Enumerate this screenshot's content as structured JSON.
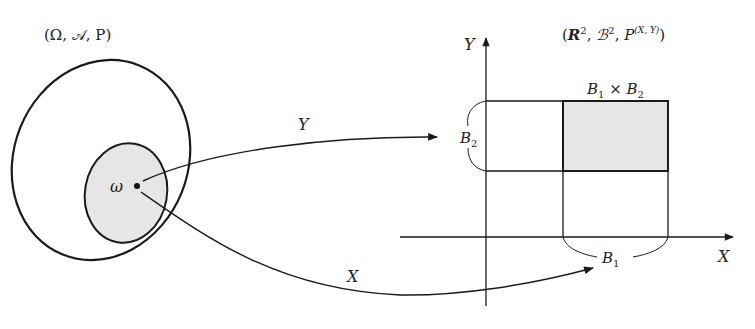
{
  "diagram": {
    "left_space_label": "(Ω, 𝒜, P)",
    "right_space_label_parts": {
      "open": "(",
      "R": "R",
      "R_sup": "2",
      "comma1": ", ",
      "B": "ℬ",
      "B_sup": "2",
      "comma2": ", ",
      "P": "P",
      "P_sup": "(X, Y)",
      "close": ")"
    },
    "omega_label": "ω",
    "map_Y_label": "Y",
    "map_X_label": "X",
    "axis_x_label": "X",
    "axis_y_label": "Y",
    "set_B1_label": "B",
    "set_B1_sub": "1",
    "set_B2_label": "B",
    "set_B2_sub": "2",
    "product_label_parts": {
      "B1": "B",
      "B1_sub": "1",
      "times": " × ",
      "B2": "B",
      "B2_sub": "2"
    },
    "colors": {
      "stroke": "#1a1a1a",
      "shade": "#e6e6e6",
      "background": "#ffffff"
    }
  }
}
